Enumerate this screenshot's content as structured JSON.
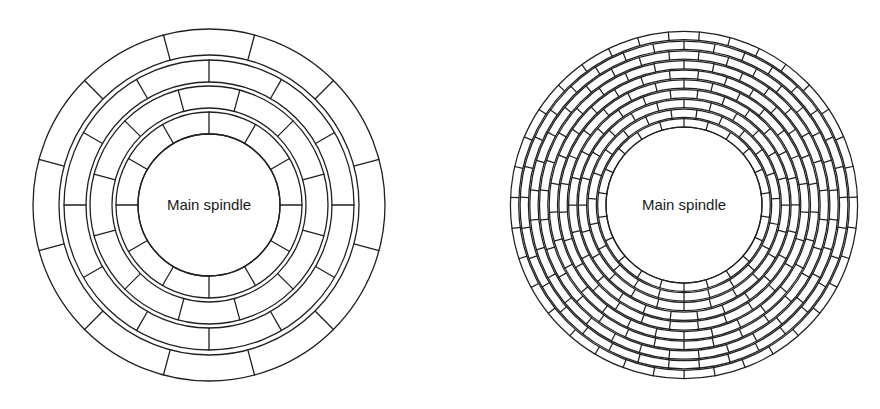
{
  "page": {
    "background_color": "#ffffff",
    "stroke_color": "#231f20",
    "width": 880,
    "height": 409
  },
  "figures": [
    {
      "id": "left",
      "name": "coarse-winding-diagram",
      "label": "Main spindle",
      "label_font_size": 15,
      "center": {
        "x": 209,
        "y": 205
      },
      "spindle_radius": 71,
      "outer_radius": 176,
      "ring_count": 4,
      "segments_per_ring": 12,
      "ring_gap": 4,
      "ring_thickness": 22,
      "stroke_width": 1.3,
      "rings": [
        {
          "index": 0,
          "inner_radius": 71,
          "outer_radius": 93,
          "segments": 12,
          "phase_deg": 0
        },
        {
          "index": 1,
          "inner_radius": 97,
          "outer_radius": 119,
          "segments": 12,
          "phase_deg": 15
        },
        {
          "index": 2,
          "inner_radius": 123,
          "outer_radius": 145,
          "segments": 12,
          "phase_deg": 0
        },
        {
          "index": 3,
          "inner_radius": 150,
          "outer_radius": 176,
          "segments": 12,
          "phase_deg": 15
        }
      ]
    },
    {
      "id": "right",
      "name": "fine-winding-diagram",
      "label": "Main spindle",
      "label_font_size": 15,
      "center": {
        "x": 244,
        "y": 205
      },
      "spindle_radius": 78,
      "outer_radius": 171,
      "ring_count": 10,
      "segments_per_ring": 30,
      "ring_gap": 1.4,
      "ring_thickness": 8,
      "stroke_width": 1.25,
      "rings": [
        {
          "index": 0,
          "inner_radius": 78.0,
          "outer_radius": 86.3,
          "segments": 22,
          "phase_deg": 0
        },
        {
          "index": 1,
          "inner_radius": 87.7,
          "outer_radius": 96.0,
          "segments": 23,
          "phase_deg": 7.8
        },
        {
          "index": 2,
          "inner_radius": 97.4,
          "outer_radius": 105.7,
          "segments": 24,
          "phase_deg": 0
        },
        {
          "index": 3,
          "inner_radius": 107.1,
          "outer_radius": 115.4,
          "segments": 26,
          "phase_deg": 6.9
        },
        {
          "index": 4,
          "inner_radius": 116.8,
          "outer_radius": 125.1,
          "segments": 27,
          "phase_deg": 0
        },
        {
          "index": 5,
          "inner_radius": 126.5,
          "outer_radius": 134.8,
          "segments": 29,
          "phase_deg": 6.2
        },
        {
          "index": 6,
          "inner_radius": 136.2,
          "outer_radius": 144.5,
          "segments": 30,
          "phase_deg": 0
        },
        {
          "index": 7,
          "inner_radius": 145.9,
          "outer_radius": 154.2,
          "segments": 32,
          "phase_deg": 5.6
        },
        {
          "index": 8,
          "inner_radius": 155.6,
          "outer_radius": 163.9,
          "segments": 33,
          "phase_deg": 0
        },
        {
          "index": 9,
          "inner_radius": 165.3,
          "outer_radius": 173.6,
          "segments": 35,
          "phase_deg": 5.1
        }
      ]
    }
  ]
}
